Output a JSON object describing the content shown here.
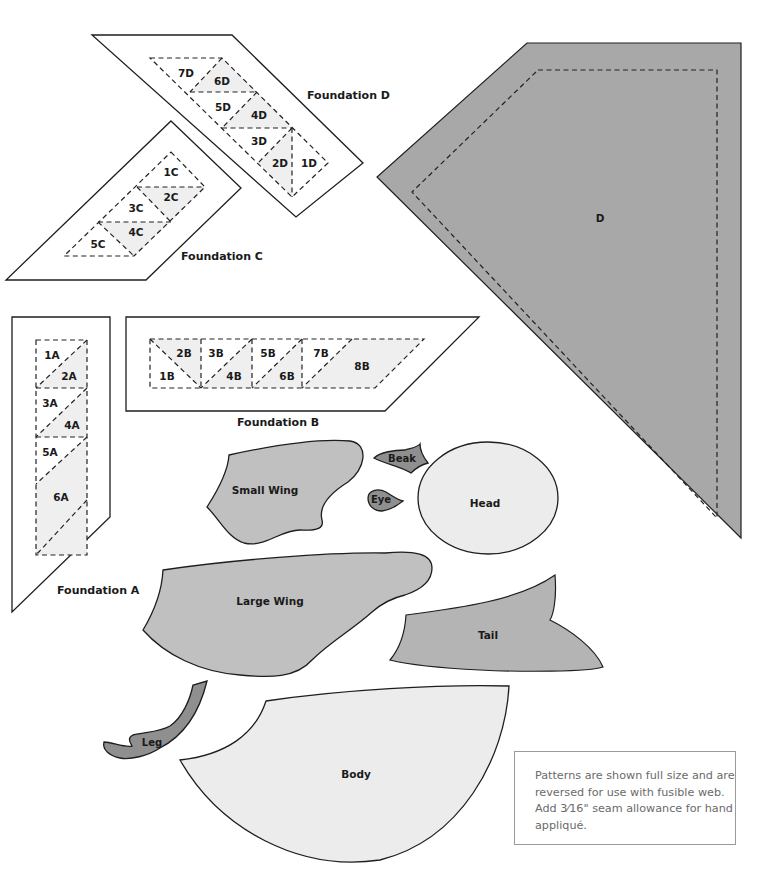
{
  "foundations": {
    "D": {
      "caption": "Foundation D",
      "segments": [
        "1D",
        "2D",
        "3D",
        "4D",
        "5D",
        "6D",
        "7D"
      ]
    },
    "C": {
      "caption": "Foundation C",
      "segments": [
        "1C",
        "2C",
        "3C",
        "4C",
        "5C"
      ]
    },
    "A": {
      "caption": "Foundation A",
      "segments": [
        "1A",
        "2A",
        "3A",
        "4A",
        "5A",
        "6A"
      ]
    },
    "B": {
      "caption": "Foundation B",
      "segments": [
        "1B",
        "2B",
        "3B",
        "4B",
        "5B",
        "6B",
        "7B",
        "8B"
      ]
    }
  },
  "pieces": {
    "D": "D",
    "small_wing": "Small Wing",
    "beak": "Beak",
    "eye": "Eye",
    "head": "Head",
    "large_wing": "Large Wing",
    "tail": "Tail",
    "leg": "Leg",
    "body": "Body"
  },
  "colors": {
    "piece_d": "#a8a8a8",
    "piece_mid": "#c0c0c0",
    "piece_light": "#ececec",
    "piece_dark": "#8f8f8f",
    "shaded_segment": "#efefef"
  },
  "note": {
    "text": "Patterns are shown full size and are reversed for use with fusible web. Add 3⁄16\" seam allowance for hand appliqué."
  }
}
